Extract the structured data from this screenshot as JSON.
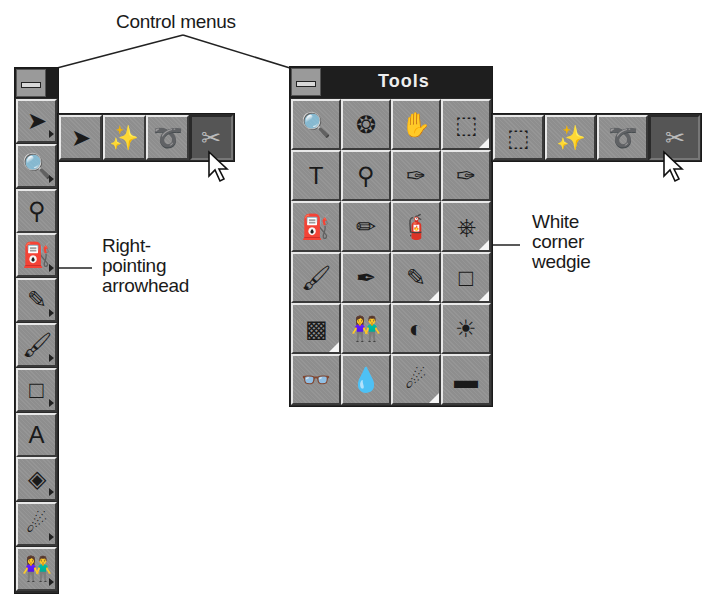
{
  "callouts": {
    "control_menus": "Control menus",
    "arrowhead": [
      "Right-",
      "pointing",
      "arrowhead"
    ],
    "wedgie": [
      "White",
      "corner",
      "wedgie"
    ]
  },
  "left_toolbar": {
    "control_menu_icon": "control-menu-icon",
    "tools": [
      {
        "name": "selection-arrow",
        "glyph": "➤",
        "arrowhead": true
      },
      {
        "name": "zoom",
        "glyph": "🔍",
        "arrowhead": true
      },
      {
        "name": "eyedropper",
        "glyph": "⚲",
        "arrowhead": false
      },
      {
        "name": "airbrush",
        "glyph": "⛽",
        "arrowhead": true
      },
      {
        "name": "pen",
        "glyph": "✎",
        "arrowhead": true
      },
      {
        "name": "paintbrush",
        "glyph": "🖌",
        "arrowhead": true
      },
      {
        "name": "rectangle",
        "glyph": "□",
        "arrowhead": true
      },
      {
        "name": "text",
        "glyph": "A",
        "arrowhead": false
      },
      {
        "name": "paint-bucket",
        "glyph": "◈",
        "arrowhead": true
      },
      {
        "name": "effect-brush",
        "glyph": "☄",
        "arrowhead": true
      },
      {
        "name": "clone-people",
        "glyph": "👫",
        "arrowhead": true
      }
    ],
    "flyout": [
      {
        "name": "arrow",
        "glyph": "➤"
      },
      {
        "name": "magic-wand",
        "glyph": "✨"
      },
      {
        "name": "lasso",
        "glyph": "➰"
      },
      {
        "name": "scissors",
        "glyph": "✂",
        "active": true
      }
    ]
  },
  "tools_palette": {
    "title": "Tools",
    "grid": [
      [
        {
          "name": "zoom-checker",
          "glyph": "🔍",
          "wedgie": false
        },
        {
          "name": "compass-wheel",
          "glyph": "❂",
          "wedgie": false
        },
        {
          "name": "hand",
          "glyph": "✋",
          "wedgie": false
        },
        {
          "name": "rectangle-marquee",
          "glyph": "⬚",
          "wedgie": true
        }
      ],
      [
        {
          "name": "text",
          "glyph": "T",
          "wedgie": false
        },
        {
          "name": "eyedropper",
          "glyph": "⚲",
          "wedgie": false
        },
        {
          "name": "eraser",
          "glyph": "✑",
          "wedgie": false
        },
        {
          "name": "eraser-fill",
          "glyph": "✑",
          "wedgie": false
        }
      ],
      [
        {
          "name": "spray-can",
          "glyph": "⛽",
          "wedgie": false
        },
        {
          "name": "pencil-house",
          "glyph": "✏",
          "wedgie": false
        },
        {
          "name": "airbrush",
          "glyph": "🧯",
          "wedgie": false
        },
        {
          "name": "rubber-stamp",
          "glyph": "⎈",
          "wedgie": true
        }
      ],
      [
        {
          "name": "paintbrush",
          "glyph": "🖌",
          "wedgie": false
        },
        {
          "name": "fountain-pen",
          "glyph": "✒",
          "wedgie": false
        },
        {
          "name": "line-pen",
          "glyph": "✎",
          "wedgie": true
        },
        {
          "name": "rectangle",
          "glyph": "□",
          "wedgie": true
        }
      ],
      [
        {
          "name": "pattern-fill",
          "glyph": "▩",
          "wedgie": true
        },
        {
          "name": "clone-people",
          "glyph": "👫",
          "wedgie": false
        },
        {
          "name": "contrast",
          "glyph": "◐",
          "wedgie": false
        },
        {
          "name": "brightness",
          "glyph": "☀",
          "wedgie": false
        }
      ],
      [
        {
          "name": "binoculars",
          "glyph": "👓",
          "wedgie": false
        },
        {
          "name": "drop",
          "glyph": "💧",
          "wedgie": false
        },
        {
          "name": "effect-brush",
          "glyph": "☄",
          "wedgie": true
        },
        {
          "name": "chalk-eraser",
          "glyph": "▬",
          "wedgie": false
        }
      ]
    ],
    "flyout": [
      {
        "name": "rectangle-marquee",
        "glyph": "⬚"
      },
      {
        "name": "magic-wand",
        "glyph": "✨"
      },
      {
        "name": "lasso",
        "glyph": "➰"
      },
      {
        "name": "scissors",
        "glyph": "✂",
        "active": true
      }
    ]
  },
  "colors": {
    "panel_dark": "#1e1e1e",
    "button_face": "#8e8e8e",
    "highlight": "#e8e8e8",
    "shadow": "#3a3a3a"
  }
}
